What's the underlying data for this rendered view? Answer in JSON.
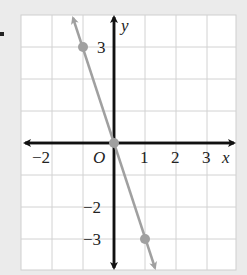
{
  "graph": {
    "x_axis_label": "x",
    "y_axis_label": "y",
    "origin_label": "O",
    "x_ticks": [
      {
        "value": -2,
        "label": "−2"
      },
      {
        "value": 1,
        "label": "1"
      },
      {
        "value": 2,
        "label": "2"
      },
      {
        "value": 3,
        "label": "3"
      }
    ],
    "y_ticks": [
      {
        "value": 3,
        "label": "3"
      },
      {
        "value": -2,
        "label": "−2"
      },
      {
        "value": -3,
        "label": "−3"
      }
    ],
    "line": {
      "equation": "y = -3x",
      "color": "#a0a0a0"
    },
    "points": [
      {
        "x": -1,
        "y": 3
      },
      {
        "x": 0,
        "y": 0
      },
      {
        "x": 1,
        "y": -3
      }
    ],
    "grid_range": {
      "x": [
        -3,
        4
      ],
      "y": [
        -4,
        4
      ]
    }
  }
}
